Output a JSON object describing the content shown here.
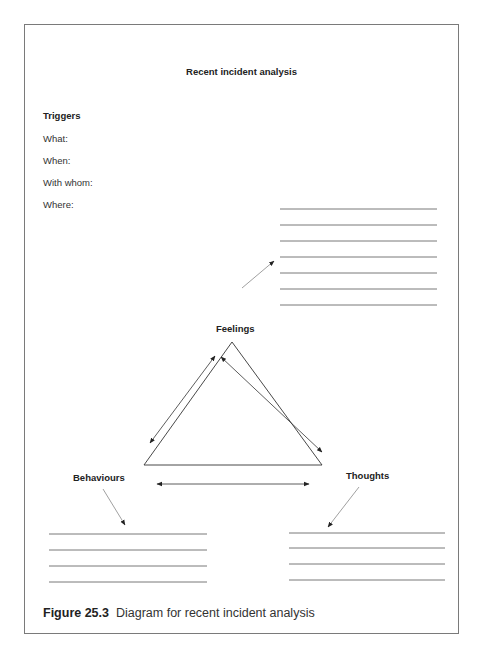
{
  "title": "Recent incident analysis",
  "triggers": {
    "heading": "Triggers",
    "fields": [
      {
        "label": "What:"
      },
      {
        "label": "When:"
      },
      {
        "label": "With whom:"
      },
      {
        "label": "Where:"
      }
    ]
  },
  "diagram": {
    "nodes": {
      "top": "Feelings",
      "left": "Behaviours",
      "right": "Thoughts"
    },
    "triggers_lines_count": 7,
    "behaviours_lines_count": 4,
    "thoughts_lines_count": 4
  },
  "caption": {
    "label": "Figure 25.3",
    "text": "Diagram for recent incident analysis"
  }
}
